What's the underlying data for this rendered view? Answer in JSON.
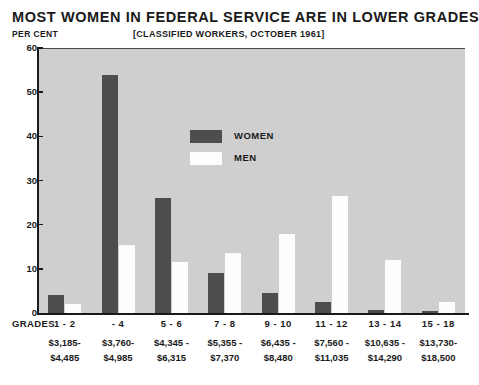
{
  "header": {
    "title": "MOST WOMEN IN FEDERAL SERVICE ARE IN LOWER GRADES",
    "percent_axis_label": "PER CENT",
    "subtitle": "[CLASSIFIED WORKERS, OCTOBER 1961]",
    "grades_axis_label": "GRADES"
  },
  "legend": {
    "position": "inside-top-center",
    "items": [
      {
        "label": "WOMEN",
        "color": "#4d4d4d",
        "swatch": "filled-dark"
      },
      {
        "label": "MEN",
        "color": "#fdfdfd",
        "swatch": "filled-white"
      }
    ]
  },
  "chart_data": {
    "type": "bar",
    "title": "MOST WOMEN IN FEDERAL SERVICE ARE IN LOWER GRADES",
    "subtitle": "[CLASSIFIED WORKERS, OCTOBER 1961]",
    "xlabel": "GRADES",
    "ylabel": "PER CENT",
    "ylim": [
      0,
      60
    ],
    "yticks": [
      0,
      10,
      20,
      30,
      40,
      50,
      60
    ],
    "grid": false,
    "legend_position": "inside-top-center",
    "categories": [
      "1 - 2",
      "- 4",
      "5 - 6",
      "7 - 8",
      "9 - 10",
      "11 - 12",
      "13 - 14",
      "15 - 18"
    ],
    "category_pay_low": [
      "$3,185-",
      "$3,760-",
      "$4,345 -",
      "$5,355 -",
      "$6,435 -",
      "$7,560 -",
      "$10,635 -",
      "$13,730-"
    ],
    "category_pay_high": [
      "$4,485",
      "$4,985",
      "$6,315",
      "$7,370",
      "$8,480",
      "$11,035",
      "$14,290",
      "$18,500"
    ],
    "series": [
      {
        "name": "WOMEN",
        "color": "#4d4d4d",
        "values": [
          4.0,
          54.0,
          26.0,
          9.0,
          4.5,
          2.5,
          0.7,
          0.5
        ]
      },
      {
        "name": "MEN",
        "color": "#fdfdfd",
        "values": [
          2.0,
          15.5,
          11.5,
          13.5,
          18.0,
          26.5,
          12.0,
          2.5
        ]
      }
    ]
  }
}
